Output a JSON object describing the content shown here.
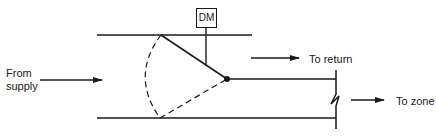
{
  "diagram": {
    "type": "damper-bypass-schematic",
    "labels": {
      "from_supply_line1": "From",
      "from_supply_line2": "supply",
      "damper_motor": "DM",
      "to_return": "To return",
      "to_zone": "To zone"
    },
    "colors": {
      "stroke": "#1a1a1a",
      "background": "#ffffff"
    },
    "elements": [
      {
        "name": "supply-duct-top-wall"
      },
      {
        "name": "supply-duct-bottom-wall"
      },
      {
        "name": "damper-motor-box",
        "label": "DM"
      },
      {
        "name": "damper-blade-solid"
      },
      {
        "name": "damper-blade-alternate-dashed"
      },
      {
        "name": "damper-pivot"
      },
      {
        "name": "zone-duct-divider"
      },
      {
        "name": "zone-outlet-wall-with-break"
      },
      {
        "name": "arrow-from-supply"
      },
      {
        "name": "arrow-to-return"
      },
      {
        "name": "arrow-to-zone"
      }
    ]
  }
}
